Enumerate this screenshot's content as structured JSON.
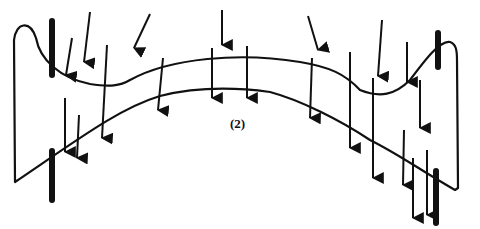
{
  "diagram": {
    "label": "(2)",
    "colors": {
      "ink": "#111111",
      "background": "#ffffff"
    }
  }
}
